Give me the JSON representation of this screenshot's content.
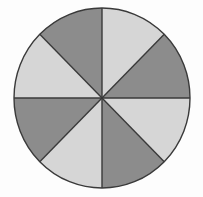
{
  "figure": {
    "background_color": "#fdfdfd",
    "width": 203,
    "height": 197
  },
  "colors": {
    "dark_gray": "#8c8c8c",
    "light_gray": "#d6d6d6",
    "stroke": "#3a3a3a",
    "background": "#fdfdfd"
  },
  "geometry": {
    "center_x": 102,
    "center_y": 98,
    "radius_x": 88,
    "radius_y": 90,
    "stroke_width": 1.4,
    "sector_count": 8,
    "sector_angle_degrees": 45
  },
  "chart_data": {
    "type": "pie",
    "title": "",
    "xlabel": "",
    "ylabel": "",
    "legend_position": "none",
    "grid": false,
    "total": 8,
    "categories": [
      "Sector 1",
      "Sector 2",
      "Sector 3",
      "Sector 4",
      "Sector 5",
      "Sector 6",
      "Sector 7",
      "Sector 8"
    ],
    "values": [
      1,
      1,
      1,
      1,
      1,
      1,
      1,
      1
    ],
    "percentages": [
      12.5,
      12.5,
      12.5,
      12.5,
      12.5,
      12.5,
      12.5,
      12.5
    ],
    "slices": [
      {
        "label": "Sector 1",
        "value": 1,
        "percent": 12.5,
        "start_angle": 0,
        "end_angle": 45,
        "color": "#d6d6d6",
        "shade": "light",
        "position": "N-NE"
      },
      {
        "label": "Sector 2",
        "value": 1,
        "percent": 12.5,
        "start_angle": 45,
        "end_angle": 90,
        "color": "#8c8c8c",
        "shade": "dark",
        "position": "NE-E"
      },
      {
        "label": "Sector 3",
        "value": 1,
        "percent": 12.5,
        "start_angle": 90,
        "end_angle": 135,
        "color": "#d6d6d6",
        "shade": "light",
        "position": "E-SE"
      },
      {
        "label": "Sector 4",
        "value": 1,
        "percent": 12.5,
        "start_angle": 135,
        "end_angle": 180,
        "color": "#8c8c8c",
        "shade": "dark",
        "position": "SE-S"
      },
      {
        "label": "Sector 5",
        "value": 1,
        "percent": 12.5,
        "start_angle": 180,
        "end_angle": 225,
        "color": "#d6d6d6",
        "shade": "light",
        "position": "S-SW"
      },
      {
        "label": "Sector 6",
        "value": 1,
        "percent": 12.5,
        "start_angle": 225,
        "end_angle": 270,
        "color": "#8c8c8c",
        "shade": "dark",
        "position": "SW-W"
      },
      {
        "label": "Sector 7",
        "value": 1,
        "percent": 12.5,
        "start_angle": 270,
        "end_angle": 315,
        "color": "#d6d6d6",
        "shade": "light",
        "position": "W-NW"
      },
      {
        "label": "Sector 8",
        "value": 1,
        "percent": 12.5,
        "start_angle": 315,
        "end_angle": 360,
        "color": "#8c8c8c",
        "shade": "dark",
        "position": "NW-N"
      }
    ]
  }
}
